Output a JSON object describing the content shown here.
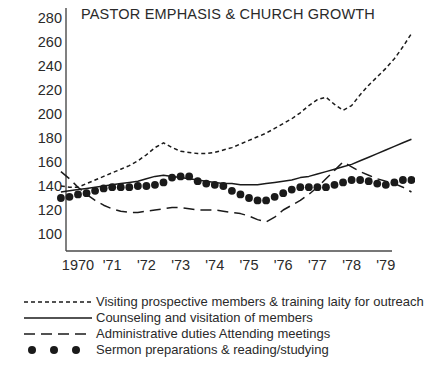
{
  "chart_data": {
    "type": "line",
    "title": "PASTOR EMPHASIS & CHURCH GROWTH",
    "xlabel": "",
    "ylabel": "",
    "ylim": [
      90,
      285
    ],
    "xlim": [
      1969.4,
      1979.9
    ],
    "grid": false,
    "legend_position": "below-plot",
    "yticks": [
      100,
      120,
      140,
      160,
      180,
      200,
      220,
      240,
      260,
      280
    ],
    "ytick_labels": [
      "100",
      "120",
      "140",
      "160",
      "180",
      "200",
      "220",
      "240",
      "260",
      "280"
    ],
    "xticks": [
      1970,
      1971,
      1972,
      1973,
      1974,
      1975,
      1976,
      1977,
      1978,
      1979
    ],
    "xtick_labels": [
      "1970",
      "'71",
      "'72",
      "'73",
      "'74",
      "'75",
      "'76",
      "'77",
      "'78",
      "'79"
    ],
    "x": [
      1969.5,
      1969.75,
      1970,
      1970.25,
      1970.5,
      1970.75,
      1971,
      1971.25,
      1971.5,
      1971.75,
      1972,
      1972.25,
      1972.5,
      1972.75,
      1973,
      1973.25,
      1973.5,
      1973.75,
      1974,
      1974.25,
      1974.5,
      1974.75,
      1975,
      1975.25,
      1975.5,
      1975.75,
      1976,
      1976.25,
      1976.5,
      1976.75,
      1977,
      1977.25,
      1977.5,
      1977.75,
      1978,
      1978.25,
      1978.5,
      1978.75,
      1979,
      1979.25,
      1979.5,
      1979.75
    ],
    "series": [
      {
        "name": "Visiting prospective members & training laity for outreach",
        "style": "dotted",
        "key": "visiting",
        "values": [
          140,
          139,
          139,
          142,
          145,
          148,
          151,
          154,
          157,
          161,
          166,
          172,
          176,
          172,
          169,
          168,
          167,
          167,
          168,
          170,
          172,
          175,
          178,
          181,
          184,
          188,
          192,
          196,
          201,
          207,
          212,
          214,
          208,
          203,
          207,
          216,
          224,
          231,
          238,
          246,
          256,
          267
        ]
      },
      {
        "name": "Counseling and visitation of members",
        "style": "solid",
        "key": "counseling",
        "values": [
          135,
          136,
          137,
          138,
          139,
          140,
          141,
          142,
          143,
          144,
          146,
          148,
          149,
          148,
          147,
          146,
          145,
          144,
          143,
          142,
          142,
          141,
          141,
          141,
          142,
          143,
          144,
          145,
          147,
          148,
          150,
          152,
          154,
          156,
          158,
          161,
          164,
          167,
          170,
          173,
          176,
          179
        ]
      },
      {
        "name": "Administrative duties  Attending meetings",
        "style": "dashed",
        "key": "administrative",
        "values": [
          152,
          146,
          139,
          133,
          128,
          124,
          121,
          119,
          118,
          118,
          119,
          120,
          121,
          122,
          122,
          121,
          120,
          120,
          120,
          119,
          118,
          117,
          115,
          112,
          110,
          114,
          120,
          124,
          128,
          133,
          139,
          146,
          153,
          160,
          156,
          152,
          149,
          146,
          144,
          142,
          139,
          135
        ]
      },
      {
        "name": "Sermon preparations & reading/studying",
        "style": "dots",
        "key": "sermon",
        "values": [
          130,
          131,
          133,
          134,
          136,
          138,
          139,
          139,
          139,
          140,
          140,
          141,
          143,
          147,
          148,
          148,
          144,
          142,
          141,
          140,
          136,
          133,
          130,
          128,
          128,
          131,
          134,
          137,
          139,
          139,
          139,
          139,
          141,
          143,
          145,
          145,
          144,
          142,
          141,
          143,
          145,
          145
        ]
      }
    ]
  },
  "legend": {
    "items": [
      {
        "label": "Visiting prospective members & training laity for outreach",
        "style": "dotted"
      },
      {
        "label": "Counseling and visitation of members",
        "style": "solid"
      },
      {
        "label": "Administrative duties  Attending meetings",
        "style": "dashed"
      },
      {
        "label": "Sermon preparations & reading/studying",
        "style": "dots"
      }
    ]
  },
  "colors": {
    "ink": "#1a1a1a",
    "axis": "#4a4a4a",
    "text": "#2a2a2a",
    "background": "#ffffff"
  }
}
